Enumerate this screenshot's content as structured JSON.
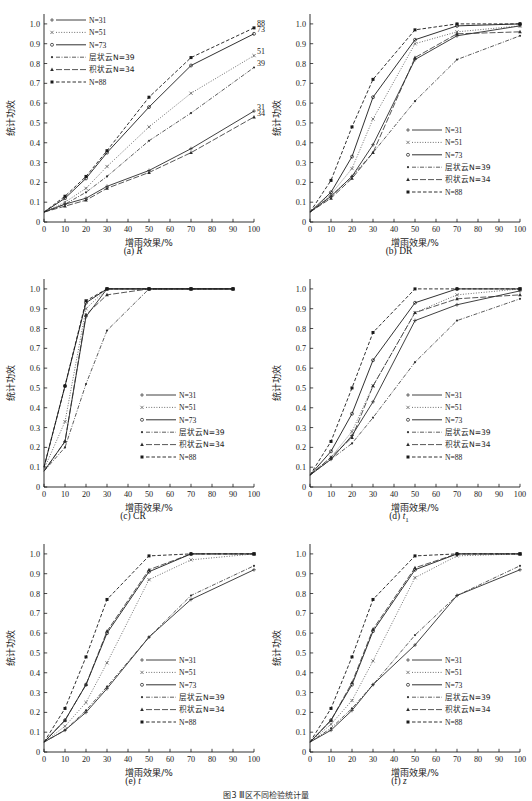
{
  "figure": {
    "caption": "图3  Ⅲ区不同检验统计量",
    "axis": {
      "xlabel": "增雨效果/%",
      "ylabel": "统计功效",
      "xticks": [
        0,
        10,
        20,
        30,
        40,
        50,
        60,
        70,
        80,
        90,
        100
      ],
      "yticks": [
        "0",
        "0.1",
        "0.2",
        "0.3",
        "0.4",
        "0.5",
        "0.6",
        "0.7",
        "0.8",
        "0.9",
        "1.0"
      ],
      "xlim": [
        0,
        100
      ],
      "ylim": [
        0,
        1.05
      ]
    },
    "legend_entries": [
      {
        "label": "N=31",
        "style": "solid",
        "marker": "plus",
        "color": "#2b2b2b"
      },
      {
        "label": "N=51",
        "style": "dotted",
        "marker": "cross",
        "color": "#4a4a4a"
      },
      {
        "label": "N=73",
        "style": "solid",
        "marker": "circle",
        "color": "#1a1a1a"
      },
      {
        "label": "层状云N=39",
        "style": "dashdot",
        "marker": "dot",
        "color": "#333333"
      },
      {
        "label": "积状云N=34",
        "style": "dashlong",
        "marker": "tri",
        "color": "#2b2b2b"
      },
      {
        "label": "N=88",
        "style": "dashed",
        "marker": "square",
        "color": "#1a1a1a"
      }
    ]
  },
  "chart_data": [
    {
      "type": "line",
      "panel": "a",
      "caption_prefix": "(a)",
      "caption_italic": "R",
      "title": "(a) R",
      "xlabel": "增雨效果/%",
      "ylabel": "统计功效",
      "xlim": [
        0,
        100
      ],
      "ylim": [
        0,
        1.05
      ],
      "grid": false,
      "legend_position": "top-left",
      "x": [
        0,
        10,
        20,
        30,
        50,
        70,
        100
      ],
      "series": [
        {
          "name": "N=31",
          "values": [
            0.05,
            0.09,
            0.12,
            0.18,
            0.26,
            0.37,
            0.56
          ],
          "end_label": "31"
        },
        {
          "name": "N=51",
          "values": [
            0.05,
            0.1,
            0.17,
            0.28,
            0.48,
            0.65,
            0.84
          ],
          "end_label": "51"
        },
        {
          "name": "N=73",
          "values": [
            0.05,
            0.12,
            0.22,
            0.35,
            0.58,
            0.79,
            0.95
          ],
          "end_label": "73"
        },
        {
          "name": "层状云N=39",
          "values": [
            0.05,
            0.09,
            0.15,
            0.23,
            0.41,
            0.55,
            0.78
          ],
          "end_label": "39"
        },
        {
          "name": "积状云N=34",
          "values": [
            0.05,
            0.08,
            0.11,
            0.17,
            0.25,
            0.35,
            0.53
          ],
          "end_label": "34"
        },
        {
          "name": "N=88",
          "values": [
            0.05,
            0.13,
            0.23,
            0.36,
            0.63,
            0.83,
            0.98
          ],
          "end_label": "88"
        }
      ]
    },
    {
      "type": "line",
      "panel": "b",
      "caption_prefix": "(b)",
      "caption_italic": "DR",
      "title": "(b) DR",
      "xlabel": "增雨效果/%",
      "ylabel": "统计功效",
      "xlim": [
        0,
        100
      ],
      "ylim": [
        0,
        1.05
      ],
      "grid": false,
      "legend_position": "bottom-right",
      "x": [
        0,
        10,
        20,
        30,
        50,
        70,
        100
      ],
      "series": [
        {
          "name": "N=31",
          "values": [
            0.05,
            0.13,
            0.23,
            0.39,
            0.82,
            0.94,
            0.99
          ]
        },
        {
          "name": "N=51",
          "values": [
            0.05,
            0.14,
            0.27,
            0.52,
            0.9,
            0.96,
            0.99
          ]
        },
        {
          "name": "N=73",
          "values": [
            0.05,
            0.15,
            0.33,
            0.63,
            0.92,
            0.99,
            1.0
          ]
        },
        {
          "name": "层状云N=39",
          "values": [
            0.05,
            0.13,
            0.23,
            0.35,
            0.61,
            0.82,
            0.94
          ]
        },
        {
          "name": "积状云N=34",
          "values": [
            0.05,
            0.12,
            0.22,
            0.35,
            0.83,
            0.95,
            0.96
          ]
        },
        {
          "name": "N=88",
          "values": [
            0.05,
            0.21,
            0.48,
            0.72,
            0.97,
            1.0,
            1.0
          ]
        }
      ]
    },
    {
      "type": "line",
      "panel": "c",
      "caption_prefix": "(c)",
      "caption_italic": "CR",
      "title": "(c) CR",
      "xlabel": "增雨效果/%",
      "ylabel": "统计功效",
      "xlim": [
        0,
        100
      ],
      "ylim": [
        0,
        1.05
      ],
      "grid": false,
      "legend_position": "bottom-right",
      "x": [
        0,
        10,
        20,
        30,
        50,
        70,
        90
      ],
      "series": [
        {
          "name": "N=31",
          "values": [
            0.08,
            0.23,
            0.86,
            1.0,
            1.0,
            1.0,
            1.0
          ]
        },
        {
          "name": "N=51",
          "values": [
            0.09,
            0.33,
            0.9,
            1.0,
            1.0,
            1.0,
            1.0
          ]
        },
        {
          "name": "N=73",
          "values": [
            0.1,
            0.51,
            0.93,
            1.0,
            1.0,
            1.0,
            1.0
          ]
        },
        {
          "name": "层状云N=39",
          "values": [
            0.08,
            0.2,
            0.52,
            0.79,
            1.0,
            1.0,
            1.0
          ]
        },
        {
          "name": "积状云N=34",
          "values": [
            0.08,
            0.23,
            0.87,
            0.97,
            1.0,
            1.0,
            1.0
          ]
        },
        {
          "name": "N=88",
          "values": [
            0.1,
            0.51,
            0.94,
            1.0,
            1.0,
            1.0,
            1.0
          ]
        }
      ]
    },
    {
      "type": "line",
      "panel": "d",
      "caption_prefix": "(d)",
      "caption_italic": "t",
      "caption_sub": "1",
      "title": "(d) t1",
      "xlabel": "增雨效果/%",
      "ylabel": "统计功效",
      "xlim": [
        0,
        100
      ],
      "ylim": [
        0,
        1.05
      ],
      "grid": false,
      "legend_position": "bottom-right",
      "x": [
        0,
        10,
        20,
        30,
        50,
        70,
        100
      ],
      "series": [
        {
          "name": "N=31",
          "values": [
            0.06,
            0.14,
            0.26,
            0.43,
            0.84,
            0.92,
            0.99
          ]
        },
        {
          "name": "N=51",
          "values": [
            0.06,
            0.15,
            0.28,
            0.51,
            0.88,
            0.97,
            1.0
          ]
        },
        {
          "name": "N=73",
          "values": [
            0.06,
            0.18,
            0.37,
            0.64,
            0.93,
            1.0,
            1.0
          ]
        },
        {
          "name": "层状云N=39",
          "values": [
            0.06,
            0.14,
            0.22,
            0.35,
            0.63,
            0.84,
            0.95
          ]
        },
        {
          "name": "积状云N=34",
          "values": [
            0.06,
            0.15,
            0.25,
            0.51,
            0.88,
            0.95,
            0.97
          ]
        },
        {
          "name": "N=88",
          "values": [
            0.06,
            0.23,
            0.5,
            0.78,
            1.0,
            1.0,
            1.0
          ]
        }
      ]
    },
    {
      "type": "line",
      "panel": "e",
      "caption_prefix": "(e)",
      "caption_italic": "t",
      "title": "(e) t",
      "xlabel": "增雨效果/%",
      "ylabel": "统计功效",
      "xlim": [
        0,
        100
      ],
      "ylim": [
        0,
        1.05
      ],
      "grid": false,
      "legend_position": "bottom-right",
      "x": [
        0,
        10,
        20,
        30,
        50,
        70,
        100
      ],
      "series": [
        {
          "name": "N=31",
          "values": [
            0.05,
            0.11,
            0.2,
            0.32,
            0.58,
            0.77,
            0.92
          ]
        },
        {
          "name": "N=51",
          "values": [
            0.05,
            0.13,
            0.25,
            0.45,
            0.87,
            0.97,
            1.0
          ]
        },
        {
          "name": "N=73",
          "values": [
            0.05,
            0.16,
            0.34,
            0.6,
            0.91,
            1.0,
            1.0
          ]
        },
        {
          "name": "层状云N=39",
          "values": [
            0.05,
            0.11,
            0.21,
            0.33,
            0.58,
            0.79,
            0.94
          ]
        },
        {
          "name": "积状云N=34",
          "values": [
            0.05,
            0.16,
            0.34,
            0.61,
            0.92,
            1.0,
            1.0
          ]
        },
        {
          "name": "N=88",
          "values": [
            0.05,
            0.22,
            0.48,
            0.77,
            0.99,
            1.0,
            1.0
          ]
        }
      ]
    },
    {
      "type": "line",
      "panel": "f",
      "caption_prefix": "(f)",
      "caption_italic": "z",
      "title": "(f) z",
      "xlabel": "增雨效果/%",
      "ylabel": "统计功效",
      "xlim": [
        0,
        100
      ],
      "ylim": [
        0,
        1.05
      ],
      "grid": false,
      "legend_position": "bottom-right",
      "x": [
        0,
        10,
        20,
        30,
        50,
        70,
        100
      ],
      "series": [
        {
          "name": "N=31",
          "values": [
            0.05,
            0.11,
            0.21,
            0.34,
            0.54,
            0.79,
            0.92
          ]
        },
        {
          "name": "N=51",
          "values": [
            0.05,
            0.14,
            0.26,
            0.46,
            0.88,
            0.99,
            1.0
          ]
        },
        {
          "name": "N=73",
          "values": [
            0.05,
            0.16,
            0.34,
            0.61,
            0.92,
            1.0,
            1.0
          ]
        },
        {
          "name": "层状云N=39",
          "values": [
            0.05,
            0.12,
            0.22,
            0.34,
            0.59,
            0.79,
            0.94
          ]
        },
        {
          "name": "积状云N=34",
          "values": [
            0.05,
            0.16,
            0.35,
            0.62,
            0.93,
            1.0,
            1.0
          ]
        },
        {
          "name": "N=88",
          "values": [
            0.05,
            0.22,
            0.48,
            0.77,
            0.99,
            1.0,
            1.0
          ]
        }
      ]
    }
  ]
}
